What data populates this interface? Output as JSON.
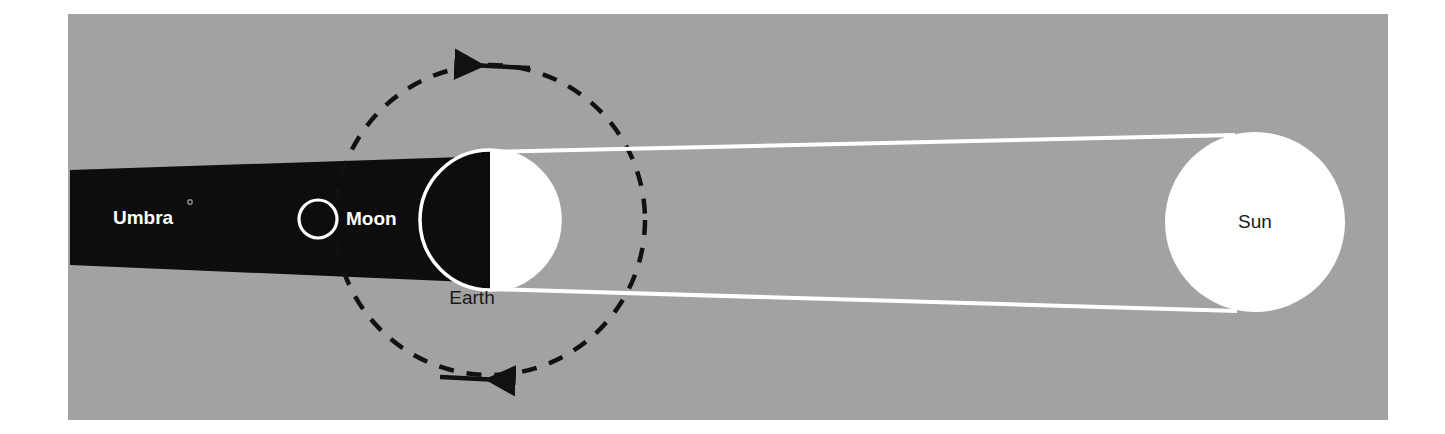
{
  "figure": {
    "kind": "astronomy-diagram",
    "panel": {
      "background_color": "#a2a2a2",
      "x": 68,
      "y": 14,
      "width": 1320,
      "height": 406,
      "page_background_color": "#ffffff"
    }
  },
  "bodies": {
    "sun": {
      "label": "Sun",
      "fill_color": "#ffffff",
      "label_color": "#1a1a1a",
      "cx": 1255,
      "cy": 222,
      "r": 90
    },
    "earth": {
      "label": "Earth",
      "lit_half_color": "#ffffff",
      "dark_half_color": "#0d0d0d",
      "outline_color": "#ffffff",
      "label_color": "#1a1a1a",
      "cx": 490,
      "cy": 220,
      "r": 70
    },
    "moon": {
      "label": "Moon",
      "fill_color": "#0d0d0d",
      "outline_color": "#ffffff",
      "label_color": "#ffffff",
      "cx": 318,
      "cy": 219,
      "r": 19
    }
  },
  "shadow": {
    "label": "Umbra",
    "fill_color": "#0d0d0d",
    "label_color": "#ffffff",
    "label_x": 143,
    "label_y": 219,
    "left_x": 70,
    "left_top_y": 170,
    "left_bottom_y": 265,
    "right_x": 492,
    "right_top_y": 156,
    "right_bottom_y": 283
  },
  "orbit": {
    "name": "moon-orbit",
    "line_color": "#111111",
    "line_style": "dashed",
    "cx": 490,
    "cy": 220,
    "r": 155,
    "direction": "counterclockwise",
    "arrow_top_label": "orbit-direction-arrow-left",
    "arrow_bottom_label": "orbit-direction-arrow-right"
  },
  "light_rays": {
    "color": "#ffffff",
    "upper": {
      "x1": 1235,
      "y1": 135,
      "x2": 487,
      "y2": 152
    },
    "lower": {
      "x1": 1237,
      "y1": 311,
      "x2": 487,
      "y2": 289
    }
  }
}
